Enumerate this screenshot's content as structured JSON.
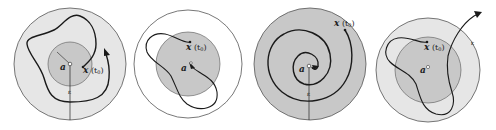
{
  "figure": {
    "panels": [
      {
        "id": "panel-1",
        "equilibrium_label": "a",
        "equilibrium_superscript": "°",
        "state_label": "x",
        "state_time": "(t",
        "state_time_sub": "0",
        "state_time_close": ")",
        "radius_label": "ε",
        "inner_label": "δ",
        "outer_fill": "#e6e6e6",
        "inner_fill": "#c8c8c8"
      },
      {
        "id": "panel-2",
        "equilibrium_label": "a",
        "equilibrium_superscript": "°",
        "state_label": "x",
        "state_time": "(t",
        "state_time_sub": "0",
        "state_time_close": ")",
        "outer_fill": "#ffffff",
        "inner_fill": "#c8c8c8"
      },
      {
        "id": "panel-3",
        "equilibrium_label": "a",
        "equilibrium_superscript": "°",
        "state_label": "x",
        "state_time": "(t",
        "state_time_sub": "0",
        "state_time_close": ")",
        "radius_label": "ε",
        "outer_fill": "#c8c8c8"
      },
      {
        "id": "panel-4",
        "equilibrium_label": "a",
        "equilibrium_superscript": "°",
        "state_label": "x",
        "state_time": "(t",
        "state_time_sub": "0",
        "state_time_close": ")",
        "radius_label": "ε",
        "outer_fill": "#e6e6e6",
        "inner_fill": "#c8c8c8"
      }
    ],
    "colors": {
      "stroke": "#1a1a1a",
      "circle_stroke": "#555555"
    }
  }
}
